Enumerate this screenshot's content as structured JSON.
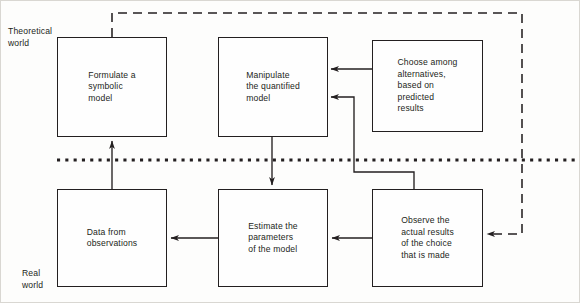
{
  "figure": {
    "background_color": "#fdfdfc",
    "stroke_color": "#231f20",
    "width": 580,
    "height": 303
  },
  "zones": [
    {
      "id": "theoretical",
      "label": "Theoretical\nworld",
      "x": 8,
      "y": 26
    },
    {
      "id": "real",
      "label": "Real\nworld",
      "x": 22,
      "y": 268
    }
  ],
  "divider": {
    "name": "world-divider-dotted-line",
    "style": "dotted",
    "y": 160,
    "x1": 57,
    "x2": 578
  },
  "nodes": [
    {
      "id": "formulate-symbolic-model",
      "label": "Formulate a\nsymbolic\nmodel",
      "x": 57,
      "y": 37,
      "w": 110,
      "h": 100,
      "zone": "theoretical"
    },
    {
      "id": "manipulate-quantified-model",
      "label": "Manipulate\nthe quantified\nmodel",
      "x": 218,
      "y": 37,
      "w": 110,
      "h": 100,
      "zone": "theoretical"
    },
    {
      "id": "choose-among-alternatives",
      "label": "Choose among\nalternatives,\nbased on\npredicted\nresults",
      "x": 372,
      "y": 40,
      "w": 111,
      "h": 92,
      "zone": "theoretical"
    },
    {
      "id": "data-from-observations",
      "label": "Data from\nobservations",
      "x": 57,
      "y": 189,
      "w": 110,
      "h": 98,
      "zone": "real"
    },
    {
      "id": "estimate-parameters",
      "label": "Estimate the\nparameters\nof the model",
      "x": 218,
      "y": 189,
      "w": 110,
      "h": 98,
      "zone": "real"
    },
    {
      "id": "observe-actual-results",
      "label": "Observe the\nactual results\nof the choice\nthat is made",
      "x": 372,
      "y": 189,
      "w": 111,
      "h": 98,
      "zone": "real"
    }
  ],
  "edges": [
    {
      "id": "choose-to-manipulate-upper",
      "from": "choose-among-alternatives",
      "to": "manipulate-quantified-model",
      "style": "solid",
      "arrow": "to"
    },
    {
      "id": "observe-to-manipulate-lower",
      "from": "observe-actual-results",
      "to": "manipulate-quantified-model",
      "style": "solid",
      "arrow": "to"
    },
    {
      "id": "data-to-formulate",
      "from": "data-from-observations",
      "to": "formulate-symbolic-model",
      "style": "solid",
      "arrow": "to"
    },
    {
      "id": "manipulate-to-estimate",
      "from": "manipulate-quantified-model",
      "to": "estimate-parameters",
      "style": "solid",
      "arrow": "to"
    },
    {
      "id": "estimate-to-data",
      "from": "estimate-parameters",
      "to": "data-from-observations",
      "style": "solid",
      "arrow": "to"
    },
    {
      "id": "observe-to-estimate",
      "from": "observe-actual-results",
      "to": "estimate-parameters",
      "style": "solid",
      "arrow": "to"
    },
    {
      "id": "formulate-to-observe-feedback",
      "from": "formulate-symbolic-model",
      "to": "observe-actual-results",
      "style": "dashed",
      "arrow": "to"
    }
  ]
}
